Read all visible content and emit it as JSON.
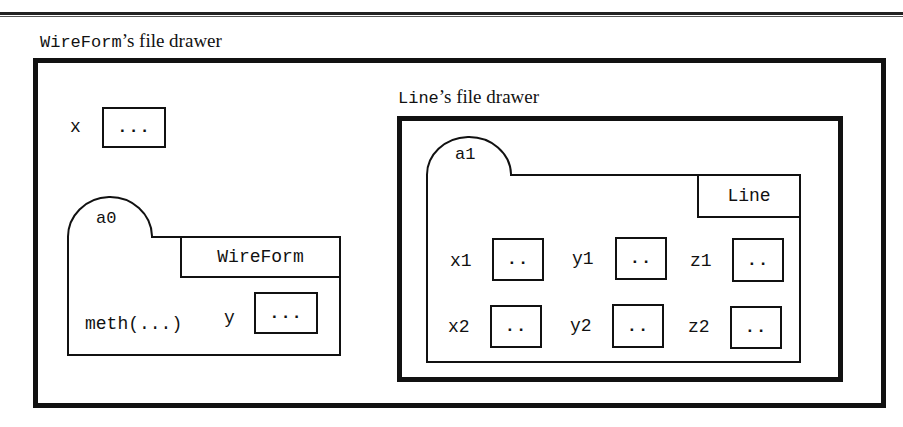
{
  "diagram": {
    "outer_drawer": {
      "class_name": "WireForm",
      "title_suffix": "’s file drawer",
      "field": {
        "name": "x",
        "value": "..."
      },
      "object": {
        "tab_label": "a0",
        "class_tag": "WireForm",
        "method": "meth(...)",
        "field": {
          "name": "y",
          "value": "..."
        }
      }
    },
    "inner_drawer": {
      "class_name": "Line",
      "title_suffix": "’s file drawer",
      "object": {
        "tab_label": "a1",
        "class_tag": "Line",
        "fields": [
          {
            "name": "x1",
            "value": ".."
          },
          {
            "name": "y1",
            "value": ".."
          },
          {
            "name": "z1",
            "value": ".."
          },
          {
            "name": "x2",
            "value": ".."
          },
          {
            "name": "y2",
            "value": ".."
          },
          {
            "name": "z2",
            "value": ".."
          }
        ]
      }
    }
  }
}
